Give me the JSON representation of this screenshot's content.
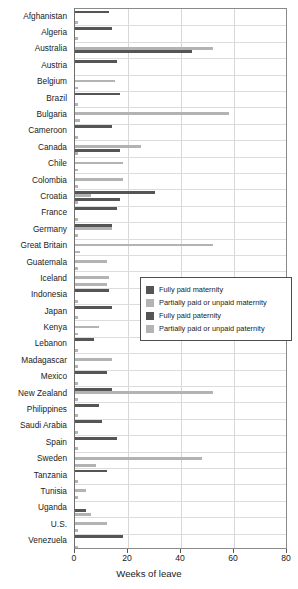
{
  "chart_data": {
    "type": "bar",
    "orientation": "horizontal",
    "title": "",
    "xlabel": "Weeks of leave",
    "ylabel": "",
    "xlim": [
      0,
      80
    ],
    "xticks": [
      0,
      20,
      40,
      60,
      80
    ],
    "grid": true,
    "legend_position": "center-right-inside",
    "categories": [
      "Afghanistan",
      "Algeria",
      "Australia",
      "Austria",
      "Belgium",
      "Brazil",
      "Bulgaria",
      "Cameroon",
      "Canada",
      "Chile",
      "Colombia",
      "Croatia",
      "France",
      "Germany",
      "Great Britain",
      "Guatemala",
      "Iceland",
      "Indonesia",
      "Japan",
      "Kenya",
      "Lebanon",
      "Madagascar",
      "Mexico",
      "New Zealand",
      "Philippines",
      "Saudi Arabia",
      "Spain",
      "Sweden",
      "Tanzania",
      "Tunisia",
      "Uganda",
      "U.S.",
      "Venezuela"
    ],
    "series": [
      {
        "name": "Fully paid maternity",
        "color": "#555555",
        "values": [
          13,
          14,
          0,
          16,
          0,
          17,
          0,
          14,
          0,
          0,
          0,
          30,
          16,
          14,
          0,
          0,
          0,
          13,
          14,
          0,
          7,
          0,
          12,
          14,
          9,
          10,
          16,
          0,
          12,
          0,
          0,
          0,
          18
        ]
      },
      {
        "name": "Partially paid or unpaid maternity",
        "color": "#b3b3b3",
        "values": [
          0,
          0,
          52,
          0,
          15,
          0,
          58,
          0,
          25,
          18,
          18,
          6,
          0,
          14,
          52,
          12,
          13,
          0,
          0,
          9,
          0,
          14,
          0,
          52,
          0,
          0,
          0,
          48,
          0,
          4,
          0,
          12,
          0
        ]
      },
      {
        "name": "Fully paid paternity",
        "color": "#555555",
        "values": [
          0,
          0,
          44,
          0,
          0,
          0,
          0,
          0,
          17,
          0,
          0,
          17,
          0,
          0,
          0,
          0,
          0,
          0,
          0,
          0,
          0,
          0,
          0,
          0,
          0,
          0,
          0,
          0,
          0,
          0,
          4,
          0,
          0
        ]
      },
      {
        "name": "Partially paid or unpaid paternity",
        "color": "#b3b3b3",
        "values": [
          1,
          1,
          0,
          0,
          1,
          1,
          2,
          1,
          1,
          1,
          1,
          1,
          1,
          1,
          2,
          1,
          12,
          1,
          1,
          1,
          1,
          1,
          1,
          1,
          1,
          1,
          1,
          8,
          1,
          1,
          6,
          1,
          1
        ]
      }
    ]
  },
  "legend": {
    "items": [
      {
        "label": "Fully paid maternity",
        "swatch": "#555555"
      },
      {
        "label": "Partially paid or unpaid maternity",
        "swatch": "#b3b3b3"
      },
      {
        "label": "Fully paid paternity",
        "swatch": "#555555"
      },
      {
        "label": "Partially paid or unpaid paternity",
        "swatch": "#b3b3b3"
      }
    ]
  }
}
